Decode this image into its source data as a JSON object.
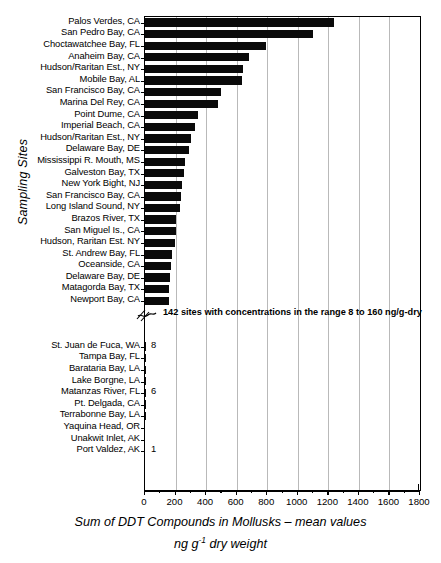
{
  "chart_data": {
    "type": "bar",
    "orientation": "horizontal",
    "title": "",
    "xlabel_line1": "Sum of DDT Compounds in Mollusks – mean values",
    "xlabel_line2_pre": "ng g",
    "xlabel_line2_sup": "-1",
    "xlabel_line2_post": " dry weight",
    "ylabel": "Sampling Sites",
    "xlim": [
      0,
      1800
    ],
    "xticks": [
      0,
      200,
      400,
      600,
      800,
      1000,
      1200,
      1400,
      1600,
      1800
    ],
    "xticklabels": [
      "0",
      "200",
      "400",
      "600",
      "800",
      "1000",
      "1200",
      "1400",
      "1600",
      "1800"
    ],
    "minor_tick_step": 100,
    "grid": "vertical major gridlines at 200 intervals",
    "legend": "none",
    "axis_break_note": "142 sites with concentrations in the range 8 to 160 ng/g-dry",
    "categories": [
      "Palos Verdes, CA",
      "San Pedro Bay, CA",
      "Choctawatchee Bay, FL",
      "Anaheim Bay, CA",
      "Hudson/Raritan Est., NY",
      "Mobile Bay, AL",
      "San Francisco Bay, CA",
      "Marina Del Rey, CA",
      "Point Dume, CA",
      "Imperial Beach, CA",
      "Hudson/Raritan Est., NY",
      "Delaware Bay, DE",
      "Mississippi R. Mouth, MS",
      "Galveston Bay, TX",
      "New York Bight, NJ",
      "San Francisco Bay, CA",
      "Long Island Sound, NY",
      "Brazos River, TX",
      "San Miguel Is., CA",
      "Hudson, Raritan Est. NY",
      "St. Andrew Bay, FL",
      "Oceanside, CA",
      "Delaware Bay, DE",
      "Matagorda Bay, TX",
      "Newport Bay, CA",
      "St. Juan de Fuca, WA",
      "Tampa Bay, FL",
      "Barataria Bay, LA",
      "Lake Borgne, LA",
      "Matanzas River, FL",
      "Pt. Delgada, CA",
      "Terrabonne Bay, LA",
      "Yaquina Head, OR",
      "Unakwit Inlet, AK",
      "Port Valdez, AK"
    ],
    "values": [
      1240,
      1100,
      790,
      680,
      640,
      635,
      500,
      480,
      345,
      325,
      300,
      285,
      265,
      255,
      240,
      235,
      230,
      205,
      200,
      195,
      175,
      170,
      165,
      160,
      155,
      8,
      7.6,
      7.2,
      6.6,
      6,
      5,
      4,
      3,
      2,
      1
    ],
    "value_labels": [
      "",
      "",
      "",
      "",
      "",
      "",
      "",
      "",
      "",
      "",
      "",
      "",
      "",
      "",
      "",
      "",
      "",
      "",
      "",
      "",
      "",
      "",
      "",
      "",
      "",
      "8",
      "",
      "",
      "",
      "6",
      "",
      "",
      "",
      "",
      "1"
    ],
    "break_after_index": 24
  }
}
